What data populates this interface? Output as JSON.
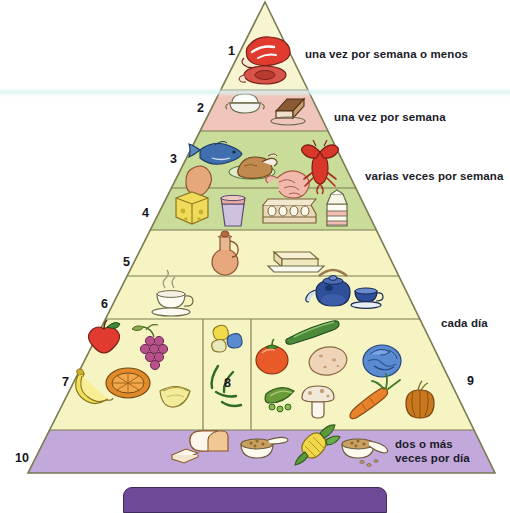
{
  "diagram": {
    "language": "es",
    "apex": {
      "x": 265,
      "y": 2
    },
    "base": {
      "left_x": 28,
      "right_x": 495,
      "y": 473
    }
  },
  "levels": [
    {
      "number": "1",
      "name": "carnes-rojas",
      "color": "#f7f4d2",
      "frequency_label": "una vez por semana o menos",
      "num_x": 228,
      "num_y": 44,
      "label_x": 305,
      "label_y": 47,
      "foods": [
        "steak",
        "ham-slice"
      ]
    },
    {
      "number": "2",
      "name": "dulces-y-postres",
      "color": "#f0c6bc",
      "frequency_label": "una vez por semana",
      "num_x": 197,
      "num_y": 101,
      "label_x": 334,
      "label_y": 110,
      "foods": [
        "sugar-bowl",
        "cake-slice"
      ]
    },
    {
      "number": "3",
      "name": "pescado-aves-mariscos",
      "color": "#c9dc9a",
      "frequency_label": "varias veces por semana",
      "num_x": 170,
      "num_y": 152,
      "label_x": 365,
      "label_y": 176,
      "foods": [
        "fish",
        "chicken-drumstick",
        "roast-chicken",
        "shrimp",
        "lobster"
      ]
    },
    {
      "number": "4",
      "name": "lacteos-y-huevos",
      "color": "#c9dc9a",
      "frequency_label": "",
      "num_x": 142,
      "num_y": 206,
      "label_x": null,
      "label_y": null,
      "foods": [
        "cheese",
        "yogurt-cup",
        "egg-carton",
        "milk-carton"
      ]
    },
    {
      "number": "5",
      "name": "aceites-y-grasas",
      "color": "#f7f4c4",
      "frequency_label": "",
      "num_x": 123,
      "num_y": 255,
      "label_x": null,
      "label_y": null,
      "foods": [
        "oil-cruet",
        "butter-dish"
      ]
    },
    {
      "number": "6",
      "name": "bebidas-cafe-y-te",
      "color": "#f7f4c4",
      "frequency_label": "",
      "num_x": 101,
      "num_y": 297,
      "label_x": null,
      "label_y": null,
      "foods": [
        "coffee-cup",
        "teapot",
        "tea-cup"
      ]
    },
    {
      "number": "7",
      "name": "frutas",
      "color": "#f7f4c4",
      "frequency_label": "",
      "num_x": 62,
      "num_y": 375,
      "label_x": null,
      "label_y": null,
      "foods": [
        "apple",
        "grapes",
        "banana",
        "orange-half",
        "melon-slice"
      ]
    },
    {
      "number": "8",
      "name": "legumbres",
      "color": "#f7f4c4",
      "frequency_label": "",
      "num_x": 224,
      "num_y": 376,
      "label_x": null,
      "label_y": null,
      "foods": [
        "beans",
        "green-beans"
      ]
    },
    {
      "number": "9",
      "name": "verduras",
      "color": "#f7f4c4",
      "frequency_label": "cada día",
      "num_x": 467,
      "num_y": 374,
      "label_x": 441,
      "label_y": 322,
      "foods": [
        "cucumber",
        "tomato",
        "potato",
        "cabbage",
        "peas",
        "mushroom",
        "carrot",
        "onion"
      ]
    },
    {
      "number": "10",
      "name": "cereales-y-panes",
      "color": "#c3a8dc",
      "frequency_label": "dos o más\nveces por día",
      "num_x": 15,
      "num_y": 451,
      "label_x": 395,
      "label_y": 444,
      "foods": [
        "bread-loaf",
        "cereal-bowl",
        "corn",
        "rice-bowl"
      ]
    }
  ],
  "bands": {
    "y_dividers": [
      90,
      131,
      188,
      230,
      276,
      319,
      430,
      473
    ],
    "column_dividers_x": [
      203,
      251
    ],
    "column_divider_y_range": [
      319,
      430
    ]
  },
  "colors": {
    "outline": "#7a7a50",
    "cream": "#f7f4d2",
    "pale_yellow": "#f7f4c4",
    "pink": "#f0c6bc",
    "green": "#c9dc9a",
    "purple": "#c3a8dc",
    "text": "#1b1b2a",
    "bottom_bar": "#6f4a99"
  },
  "bottom_bar": {
    "label": ""
  }
}
